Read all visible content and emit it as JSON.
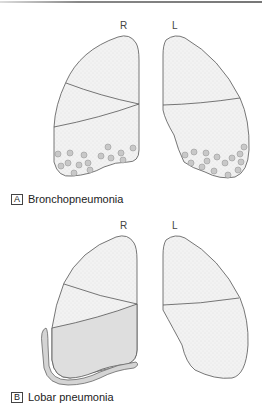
{
  "panels": [
    {
      "letter": "A",
      "title": "Bronchopneumonia",
      "side_labels": {
        "right": "R",
        "left": "L"
      },
      "description": "Patchy consolidation (small nodules) scattered in lower zones of both lungs"
    },
    {
      "letter": "B",
      "title": "Lobar pneumonia",
      "side_labels": {
        "right": "R",
        "left": "L"
      },
      "description": "Consolidation of entire right lower lobe with pleural involvement"
    }
  ],
  "colors": {
    "lung_fill": "#f1f1f1",
    "outline": "#555555",
    "consolidation": "#dedede",
    "nodule": "#c8c8c8"
  }
}
